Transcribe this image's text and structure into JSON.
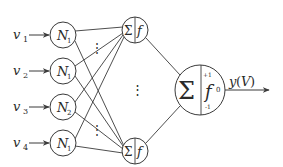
{
  "diagram": {
    "type": "neural-network",
    "colors": {
      "stroke": "#3a3a3a",
      "text": "#2a2a2a",
      "background": "#ffffff"
    },
    "inputs": [
      {
        "var": "v",
        "sub": "1",
        "node_label": "N",
        "node_sub": "1",
        "cy": 35
      },
      {
        "var": "v",
        "sub": "2",
        "node_label": "N",
        "node_sub": "1",
        "cy": 71
      },
      {
        "var": "v",
        "sub": "3",
        "node_label": "N",
        "node_sub": "2",
        "cy": 107
      },
      {
        "var": "v",
        "sub": "4",
        "node_label": "N",
        "node_sub": "1",
        "cy": 143
      }
    ],
    "hidden": [
      {
        "sum": "Σ",
        "act": "f",
        "cy": 30
      },
      {
        "sum": "Σ",
        "act": "f",
        "cy": 151
      }
    ],
    "hidden_ellipsis": "⋮",
    "input_ellipsis": "⋮",
    "output_node": {
      "sum": "Σ",
      "act": "f",
      "upper": "+1",
      "lower": "-1",
      "zero": "0"
    },
    "output_label": {
      "y": "y",
      "open": "(",
      "V": "V",
      "close": ")"
    }
  }
}
